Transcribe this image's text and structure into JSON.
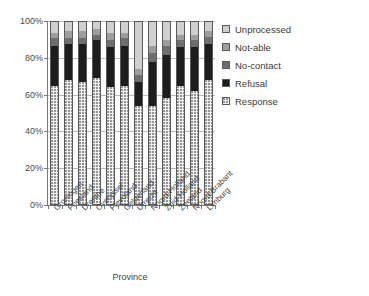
{
  "chart_data": {
    "type": "bar",
    "subtype": "100% stacked column",
    "title": "",
    "xlabel": "Province",
    "ylabel": "",
    "ylim": [
      0,
      100
    ],
    "yunit": "%",
    "grid": true,
    "legend_position": "right",
    "ytick_labels": [
      "100%",
      "80%",
      "60%",
      "40%",
      "20%",
      "0%"
    ],
    "ytick_values": [
      100,
      80,
      60,
      40,
      20,
      0
    ],
    "categories": [
      "Groningen",
      "Friesland",
      "Drenthe",
      "Overijssel",
      "Flevoland",
      "Gelderland",
      "Utrecht",
      "Noord-Holland",
      "Zuid-Holland",
      "Zeeland",
      "Noord-Brabant",
      "Limburg"
    ],
    "series": [
      {
        "name": "Response",
        "key": "response",
        "color": "#f2f2f2",
        "pattern": "dotted",
        "values": [
          65,
          68,
          67,
          69,
          64,
          65,
          54,
          54,
          58,
          65,
          62,
          68
        ]
      },
      {
        "name": "Refusal",
        "key": "refusal",
        "color": "#1d1d1d",
        "pattern": "solid",
        "values": [
          22,
          20,
          21,
          21,
          22,
          22,
          13,
          24,
          24,
          21,
          24,
          20
        ]
      },
      {
        "name": "No-contact",
        "key": "nocontact",
        "color": "#6e6e6e",
        "pattern": "solid",
        "values": [
          4,
          3,
          3,
          3,
          4,
          4,
          4,
          5,
          5,
          4,
          4,
          4
        ]
      },
      {
        "name": "Not-able",
        "key": "notable",
        "color": "#9d9d9d",
        "pattern": "solid",
        "values": [
          3,
          4,
          4,
          3,
          4,
          3,
          3,
          4,
          3,
          3,
          3,
          3
        ]
      },
      {
        "name": "Unprocessed",
        "key": "unprocessed",
        "color": "#cfcfcf",
        "pattern": "solid",
        "values": [
          6,
          5,
          5,
          4,
          6,
          6,
          26,
          13,
          10,
          7,
          7,
          5
        ]
      }
    ]
  },
  "legend": {
    "items": [
      {
        "label": "Unprocessed",
        "key": "unprocessed"
      },
      {
        "label": "Not-able",
        "key": "notable"
      },
      {
        "label": "No-contact",
        "key": "nocontact"
      },
      {
        "label": "Refusal",
        "key": "refusal"
      },
      {
        "label": "Response",
        "key": "response"
      }
    ]
  },
  "axis": {
    "x_title": "Province"
  }
}
